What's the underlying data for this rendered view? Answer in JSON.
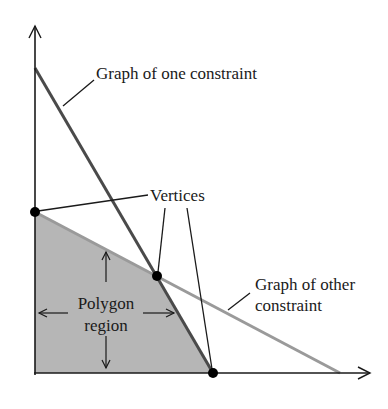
{
  "diagram": {
    "labels": {
      "one_constraint": "Graph of one constraint",
      "vertices": "Vertices",
      "other_constraint_line1": "Graph of other",
      "other_constraint_line2": "constraint",
      "polygon_line1": "Polygon",
      "polygon_line2": "region"
    },
    "colors": {
      "axis": "#1a1a1a",
      "one_constraint_line": "#4a4a4a",
      "other_constraint_line": "#9a9a9a",
      "region_fill": "#b6b6b6",
      "vertex": "#000000"
    },
    "vertices": [
      {
        "name": "y-intercept-vertex",
        "x": 35,
        "y": 212
      },
      {
        "name": "intersection-vertex",
        "x": 157,
        "y": 276
      },
      {
        "name": "x-intercept-vertex",
        "x": 213,
        "y": 373
      }
    ]
  }
}
